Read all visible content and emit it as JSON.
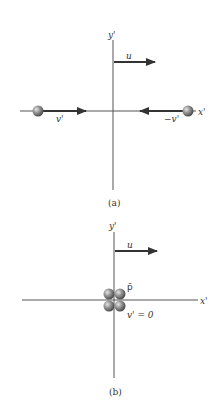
{
  "figure": {
    "panel_a": {
      "caption": "(a)",
      "axis_x_label": "x'",
      "axis_y_label": "y'",
      "frame_velocity_label": "u",
      "left_particle_velocity_label": "v'",
      "right_particle_velocity_label": "−v'"
    },
    "panel_b": {
      "caption": "(b)",
      "axis_x_label": "x'",
      "axis_y_label": "y'",
      "frame_velocity_label": "u",
      "composite_particle_label": "p̄",
      "composite_velocity_label": "v' = 0"
    },
    "colors": {
      "axis": "#555555",
      "arrow": "#333333",
      "sphere": "#8a8a8a"
    }
  }
}
